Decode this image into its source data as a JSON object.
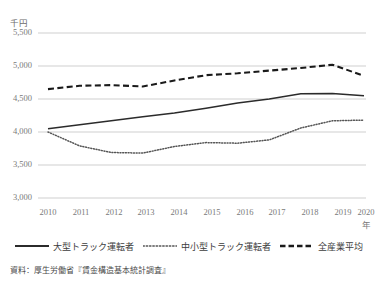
{
  "chart_data": {
    "type": "line",
    "title": "",
    "unit_label": "千円",
    "xlabel": "年",
    "ylabel": "",
    "x": [
      "2010",
      "2011",
      "2012",
      "2013",
      "2014",
      "2015",
      "2016",
      "2017",
      "2018",
      "2019",
      "2020"
    ],
    "categories": [
      "2010",
      "2011",
      "2012",
      "2013",
      "2014",
      "2015",
      "2016",
      "2017",
      "2018",
      "2019",
      "2020"
    ],
    "ylim": [
      3000,
      5500
    ],
    "yticks": [
      "3,000",
      "3,500",
      "4,000",
      "4,500",
      "5,000",
      "5,500"
    ],
    "ytick_values": [
      3000,
      3500,
      4000,
      4500,
      5000,
      5500
    ],
    "grid": true,
    "legend_position": "bottom",
    "series": [
      {
        "name": "大型トラック運転者",
        "style": "solid",
        "color": "#2b2b2b",
        "values": [
          4050,
          4110,
          4170,
          4230,
          4290,
          4360,
          4440,
          4500,
          4580,
          4585,
          4550
        ]
      },
      {
        "name": "中小型トラック運転者",
        "style": "dotted",
        "color": "#555555",
        "values": [
          4000,
          3790,
          3690,
          3680,
          3780,
          3840,
          3830,
          3880,
          4060,
          4170,
          4180
        ]
      },
      {
        "name": "全産業平均",
        "style": "dashed",
        "color": "#1a1a1a",
        "values": [
          4650,
          4700,
          4710,
          4690,
          4780,
          4860,
          4890,
          4930,
          4970,
          5020,
          4850
        ]
      }
    ]
  },
  "legend": {
    "items": [
      {
        "label": "大型トラック運転者",
        "style": "solid"
      },
      {
        "label": "中小型トラック運転者",
        "style": "dotted"
      },
      {
        "label": "全産業平均",
        "style": "dashed"
      }
    ]
  },
  "source": {
    "text": "資料：厚生労働省『賃金構造基本統計調査』"
  },
  "colors": {
    "grid": "#cfcfcf",
    "text": "#6b6b6b",
    "solid": "#2b2b2b",
    "dotted": "#555555",
    "dashed": "#1a1a1a"
  }
}
